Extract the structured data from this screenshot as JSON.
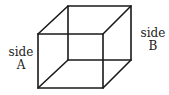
{
  "figure": {
    "type": "necker-cube",
    "stroke_color": "#1a1a1a",
    "vertices": {
      "front_top_left": [
        38,
        34
      ],
      "front_top_right": [
        103,
        34
      ],
      "front_bottom_left": [
        38,
        88
      ],
      "front_bottom_right": [
        103,
        88
      ],
      "back_top_left": [
        68,
        6
      ],
      "back_top_right": [
        131,
        6
      ],
      "back_bottom_left": [
        68,
        60
      ],
      "back_bottom_right": [
        131,
        60
      ]
    }
  },
  "labels": {
    "side_a": {
      "line1": "side",
      "line2": "A"
    },
    "side_b": {
      "line1": "side",
      "line2": "B"
    }
  }
}
